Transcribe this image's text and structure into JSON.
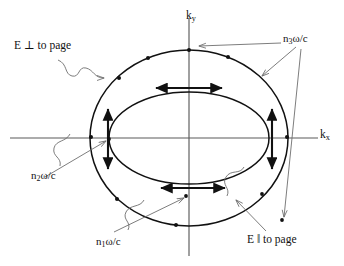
{
  "figure": {
    "kind": "optics-index-surface-diagram",
    "axes": {
      "x_label_prefix": "k",
      "x_label_sub": "x",
      "y_label_prefix": "k",
      "y_label_sub": "y",
      "origin_px": [
        189,
        138
      ]
    },
    "labels": {
      "e_perp": "E ⊥ to page",
      "e_parallel": "E ‖ to page",
      "n3": {
        "prefix": "n",
        "sub": "3",
        "suffix": "ω/c"
      },
      "n2": {
        "prefix": "n",
        "sub": "2",
        "suffix": "ω/c"
      },
      "n1": {
        "prefix": "n",
        "sub": "1",
        "suffix": "ω/c"
      }
    },
    "curves": [
      {
        "name": "outer-ellipse",
        "label": "n3ω/c",
        "cx": 189,
        "cy": 138,
        "rx": 99,
        "ry": 88
      },
      {
        "name": "inner-ellipse",
        "label": "n1ω/c / n2ω/c",
        "cx": 189,
        "cy": 138,
        "rx": 80,
        "ry": 46
      }
    ],
    "field_arrows": [
      {
        "name": "left-vertical-double-arrow",
        "orientation": "vertical",
        "x": 108,
        "y1": 108,
        "y2": 170
      },
      {
        "name": "right-vertical-double-arrow",
        "orientation": "vertical",
        "x": 272,
        "y1": 108,
        "y2": 170
      },
      {
        "name": "top-horizontal-double-arrow",
        "orientation": "horizontal",
        "y": 88,
        "x1": 155,
        "x2": 223
      },
      {
        "name": "bottom-horizontal-double-arrow",
        "orientation": "horizontal",
        "y": 188,
        "x1": 160,
        "x2": 226
      }
    ],
    "colors": {
      "ink": "#111111",
      "axis": "#555555",
      "leader": "#777777",
      "background": "#ffffff"
    }
  }
}
